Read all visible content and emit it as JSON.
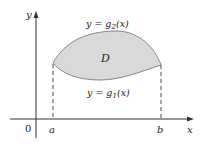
{
  "diagram": {
    "region_label": "D",
    "upper_curve_label": {
      "prefix": "y = g",
      "sub": "2",
      "suffix": "(x)"
    },
    "lower_curve_label": {
      "prefix": "y = g",
      "sub": "1",
      "suffix": "(x)"
    },
    "axes": {
      "x_label": "x",
      "y_label": "y",
      "origin_label": "0"
    },
    "bounds": {
      "a": "a",
      "b": "b"
    },
    "colors": {
      "fill": "#d9d9d9",
      "stroke": "#888888",
      "axis": "#333333"
    }
  }
}
